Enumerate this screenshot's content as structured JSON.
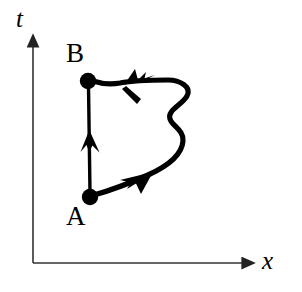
{
  "figure": {
    "type": "spacetime-path-diagram",
    "background_color": "#ffffff",
    "ink_color": "#000000",
    "axes": {
      "vertical": {
        "label": "t",
        "name": "time-axis",
        "style": "italic-serif",
        "origin": [
          33,
          263
        ],
        "tip": [
          33,
          38
        ],
        "has_arrowhead": true
      },
      "horizontal": {
        "label": "x",
        "name": "space-axis",
        "style": "italic-serif",
        "origin": [
          33,
          263
        ],
        "tip": [
          253,
          263
        ],
        "has_arrowhead": true
      }
    },
    "points": [
      {
        "label": "A",
        "name": "point-a",
        "marker": "filled-circle",
        "position": [
          90,
          197
        ],
        "label_position": [
          66,
          203
        ]
      },
      {
        "label": "B",
        "name": "point-b",
        "marker": "filled-circle",
        "position": [
          88,
          81
        ],
        "label_position": [
          66,
          40
        ]
      }
    ],
    "paths": [
      {
        "name": "straight-path-a-to-b",
        "kind": "straight",
        "from": "A",
        "to": "B",
        "direction": "upward",
        "arrow_at_midpoint": true,
        "arrow_direction": "up"
      },
      {
        "name": "wiggly-path-a-to-b",
        "kind": "wiggly",
        "from": "A",
        "to": "B",
        "direction": "counterclockwise-loop-right",
        "arrow_count": 2,
        "arrow_directions": [
          "up-right",
          "left"
        ]
      }
    ],
    "colors": {
      "ink": "#000000",
      "background": "#ffffff",
      "axis": "#333333"
    }
  }
}
